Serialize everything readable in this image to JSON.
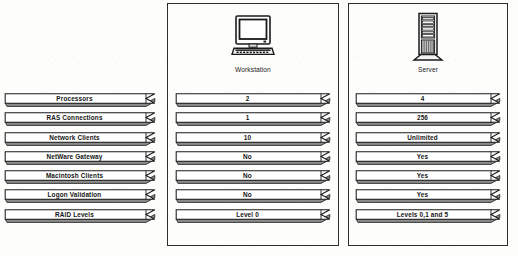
{
  "figure": {
    "type": "comparison-table",
    "columns": [
      {
        "id": "labels",
        "header": "",
        "icon": ""
      },
      {
        "id": "workstation",
        "header": "Workstation",
        "icon": "workstation-computer-icon"
      },
      {
        "id": "server",
        "header": "Server",
        "icon": "server-tower-icon"
      }
    ],
    "rows": [
      {
        "label": "Processors",
        "workstation": "2",
        "server": "4"
      },
      {
        "label": "RAS Connections",
        "workstation": "1",
        "server": "256"
      },
      {
        "label": "Network Clients",
        "workstation": "10",
        "server": "Unlimited"
      },
      {
        "label": "NetWare Gateway",
        "workstation": "No",
        "server": "Yes"
      },
      {
        "label": "Macintosh Clients",
        "workstation": "No",
        "server": "Yes"
      },
      {
        "label": "Logon Validation",
        "workstation": "No",
        "server": "Yes"
      },
      {
        "label": "RAID Levels",
        "workstation": "Level 0",
        "server": "Levels 0,1 and 5"
      }
    ]
  },
  "colors": {
    "ink": "#1b1b1b",
    "outline": "#2c2c2c",
    "paper": "#fdfdfb",
    "shadow": "#555555"
  }
}
